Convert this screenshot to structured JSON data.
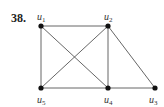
{
  "problem": {
    "number": "38."
  },
  "graph": {
    "nodes": [
      {
        "id": "u1",
        "label": "u",
        "sub": "1",
        "x": 41,
        "y": 26,
        "lx": 37,
        "ly": 20
      },
      {
        "id": "u2",
        "label": "u",
        "sub": "2",
        "x": 108,
        "y": 26,
        "lx": 104,
        "ly": 20
      },
      {
        "id": "u3",
        "label": "u",
        "sub": "3",
        "x": 155,
        "y": 88,
        "lx": 149,
        "ly": 103
      },
      {
        "id": "u4",
        "label": "u",
        "sub": "4",
        "x": 108,
        "y": 88,
        "lx": 104,
        "ly": 103
      },
      {
        "id": "u5",
        "label": "u",
        "sub": "5",
        "x": 41,
        "y": 88,
        "lx": 37,
        "ly": 103
      }
    ],
    "edges": [
      [
        "u1",
        "u2"
      ],
      [
        "u1",
        "u5"
      ],
      [
        "u1",
        "u4"
      ],
      [
        "u2",
        "u5"
      ],
      [
        "u2",
        "u4"
      ],
      [
        "u2",
        "u3"
      ],
      [
        "u5",
        "u4"
      ],
      [
        "u4",
        "u3"
      ]
    ],
    "colors": {
      "edge": "#555555",
      "node": "#111111",
      "label": "#333333"
    }
  }
}
